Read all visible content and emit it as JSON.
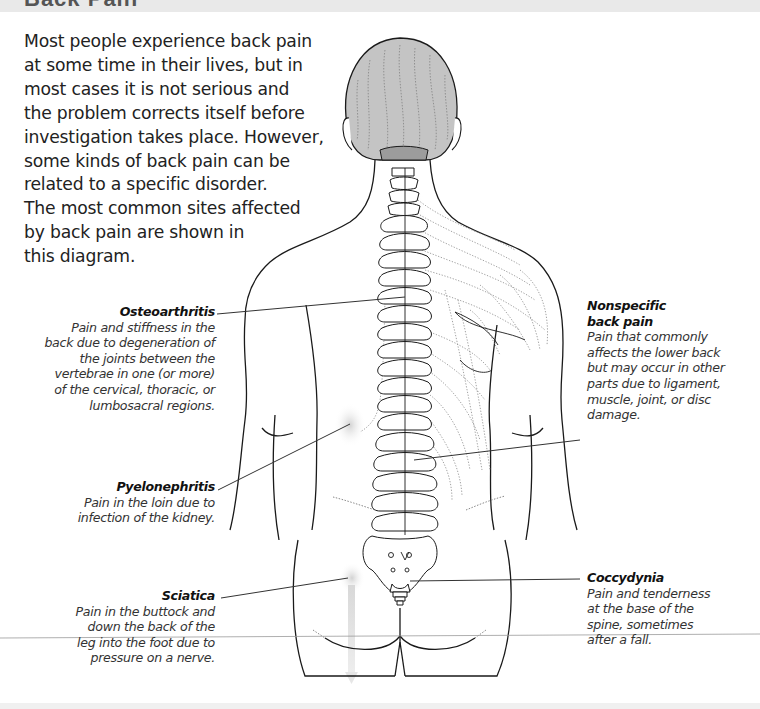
{
  "header": {
    "title": "Back Pain"
  },
  "intro": {
    "lines": [
      "Most people experience back pain",
      "at some time in their lives, but in",
      "most cases it is not serious and",
      "the problem corrects itself before",
      "investigation takes place. However,",
      "some kinds of back pain can be",
      "related to a specific disorder.",
      "The most common sites affected",
      "by back pain are shown in",
      "this diagram."
    ]
  },
  "labels": {
    "osteoarthritis": {
      "title": "Osteoarthritis",
      "lines": [
        "Pain and stiffness in the",
        "back due to degeneration of",
        "the joints between the",
        "vertebrae in one (or more)",
        "of the cervical, thoracic, or",
        "lumbosacral regions."
      ]
    },
    "pyelonephritis": {
      "title": "Pyelonephritis",
      "lines": [
        "Pain in the loin due to",
        "infection of the kidney."
      ]
    },
    "sciatica": {
      "title": "Sciatica",
      "lines": [
        "Pain in the buttock and",
        "down the back of the",
        "leg into the foot due to",
        "pressure on a nerve."
      ]
    },
    "nonspecific": {
      "title_lines": [
        "Nonspecific",
        "back pain"
      ],
      "lines": [
        "Pain that commonly",
        "affects the lower back",
        "but may occur in other",
        "parts due to ligament,",
        "muscle, joint, or disc",
        "damage."
      ]
    },
    "coccydynia": {
      "title": "Coccydynia",
      "lines": [
        "Pain and tenderness",
        "at the base of the",
        "spine, sometimes",
        "after a fall."
      ]
    }
  },
  "colors": {
    "outline": "#1a1a1a",
    "hair": "#b8b8b8",
    "pain_glow": "#d6d6d6",
    "leader_line": "#333333",
    "band": "#e9e9e9"
  }
}
